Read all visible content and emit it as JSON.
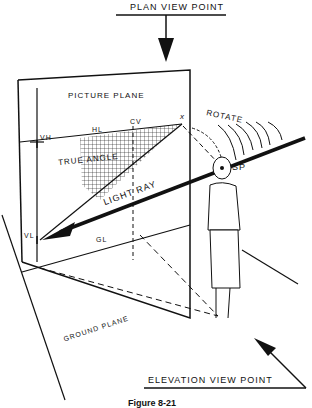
{
  "labels": {
    "plan_view_point": "PLAN VIEW POINT",
    "picture_plane": "PICTURE PLANE",
    "vh": "VH",
    "hl": "HL",
    "cv": "CV",
    "x": "x",
    "rotate": "ROTATE",
    "true_angle": "TRUE ANGLE",
    "sp": "SP",
    "light_ray": "LIGHT RAY",
    "vl": "VL",
    "gl": "GL",
    "ground_plane": "GROUND PLANE",
    "elevation_view_point": "ELEVATION VIEW POINT",
    "caption": "Figure 8-21"
  },
  "colors": {
    "ink": "#111111",
    "background": "#ffffff"
  }
}
